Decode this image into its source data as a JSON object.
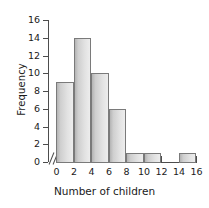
{
  "chart_data": {
    "type": "bar",
    "title": "",
    "subtitle": "",
    "xlabel": "Number of children",
    "ylabel": "Frequency",
    "bin_width": 2,
    "categories": [
      "0-2",
      "2-4",
      "4-6",
      "6-8",
      "8-10",
      "10-12",
      "12-14",
      "14-16"
    ],
    "bin_edges": [
      0,
      2,
      4,
      6,
      8,
      10,
      12,
      14,
      16
    ],
    "values": [
      9,
      14,
      10,
      6,
      1,
      1,
      0,
      1
    ],
    "x_ticks": [
      0,
      2,
      4,
      6,
      8,
      10,
      12,
      14,
      16
    ],
    "y_ticks": [
      0,
      2,
      4,
      6,
      8,
      10,
      12,
      14,
      16
    ],
    "xlim": [
      0,
      16
    ],
    "ylim": [
      0,
      16
    ],
    "grid": false,
    "legend": false,
    "axis_break": "//",
    "bar_fill": "#d8d8d8",
    "bar_edge": "#7a7a7a",
    "background": "#ffffff"
  }
}
